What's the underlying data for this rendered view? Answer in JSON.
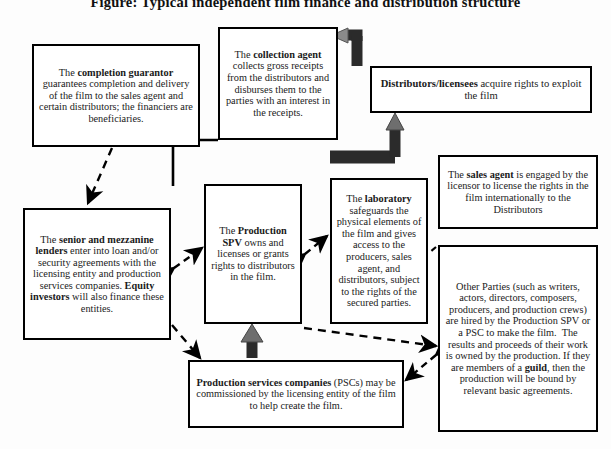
{
  "title": "Figure: Typical independent film finance and distribution structure",
  "diagram": {
    "type": "flow-diagram",
    "nodes": [
      {
        "id": "completion-guarantor",
        "name": "completion-guarantor-box",
        "text_html": "The <b>completion guarantor</b> guarantees completion and delivery of the film to the sales agent and certain distributors; the financiers are beneficiaries.",
        "text": "The completion guarantor guarantees completion and delivery of the film to the sales agent and certain distributors; the financiers are beneficiaries."
      },
      {
        "id": "collection-agent",
        "name": "collection-agent-box",
        "text_html": "The <b>collection agent</b> collects gross receipts from the distributors and disburses them to the parties with an interest in the receipts.",
        "text": "The collection agent collects gross receipts from the distributors and disburses them to the parties with an interest in the receipts."
      },
      {
        "id": "distributors",
        "name": "distributors-licensees-box",
        "text_html": "<b>Distributors/licensees</b> acquire rights to exploit the film",
        "text": "Distributors/licensees acquire rights to exploit the film"
      },
      {
        "id": "sales-agent",
        "name": "sales-agent-box",
        "text_html": "The <b>sales agent</b> is engaged by the licensor to license the rights in the film internationally to the Distributors",
        "text": "The sales agent is engaged by the licensor to license the rights in the film internationally to the Distributors"
      },
      {
        "id": "production-spv",
        "name": "production-spv-box",
        "text_html": "The <b>Production SPV</b> owns and licenses or grants rights to distributors in the film.",
        "text": "The Production SPV owns and licenses or grants rights to distributors in the film."
      },
      {
        "id": "laboratory",
        "name": "laboratory-box",
        "text_html": "The <b>laboratory</b> safeguards the physical elements of the film and gives access to the producers, sales agent, and distributors, subject to the rights of the secured parties.",
        "text": "The laboratory safeguards the physical elements of the film and gives access to the producers, sales agent, and distributors, subject to the rights of the secured parties."
      },
      {
        "id": "lenders",
        "name": "senior-mezzanine-lenders-box",
        "text_html": "The <b>senior and mezzanine lenders</b> enter into loan and/or security agreements with the licensing entity and production services companies. <b>Equity investors</b> will also finance these entities.",
        "text": "The senior and mezzanine lenders enter into loan and/or security agreements with the licensing entity and production services companies. Equity investors will also finance these entities."
      },
      {
        "id": "other-parties",
        "name": "other-parties-box",
        "text_html": "Other Parties (such as writers, actors, directors, composers, producers, and production crews) are hired by the Production SPV or a PSC to make the film.&nbsp; The results and proceeds of their work is owned by the production. If they are members of a <b>guild</b>, then the production will be bound by relevant basic agreements.",
        "text": "Other Parties (such as writers, actors, directors, composers, producers, and production crews) are hired by the Production SPV or a PSC to make the film. The results and proceeds of their work is owned by the production. If they are members of a guild, then the production will be bound by relevant basic agreements."
      },
      {
        "id": "psc",
        "name": "production-services-companies-box",
        "text_html": "<b>Production services companies</b> (PSCs) may be commissioned by the licensing entity of the film to help create the film.",
        "text": "Production services companies (PSCs) may be commissioned by the licensing entity of the film to help create the film."
      }
    ],
    "connectors": [
      {
        "id": "c1",
        "name": "connector-guarantor-to-lenders",
        "style": "dashed-arrow",
        "from": "completion-guarantor",
        "to": "lenders"
      },
      {
        "id": "c2",
        "name": "connector-collection-agent-to-spv",
        "style": "solid-elbow",
        "from": "collection-agent",
        "to": "production-spv"
      },
      {
        "id": "c3",
        "name": "connector-distributors-to-collection-agent",
        "style": "block-arrow",
        "from": "distributors",
        "to": "collection-agent"
      },
      {
        "id": "c4",
        "name": "connector-spv-to-distributors",
        "style": "block-arrow-up",
        "from": "production-spv",
        "to": "distributors"
      },
      {
        "id": "c5",
        "name": "connector-spv-to-laboratory",
        "style": "dashed-double-arrow",
        "from": "production-spv",
        "to": "laboratory"
      },
      {
        "id": "c6",
        "name": "connector-lenders-to-spv",
        "style": "dashed-double-arrow",
        "from": "lenders",
        "to": "production-spv"
      },
      {
        "id": "c7",
        "name": "connector-lenders-to-psc",
        "style": "dashed-arrow",
        "from": "lenders",
        "to": "psc"
      },
      {
        "id": "c8",
        "name": "connector-psc-to-spv",
        "style": "block-arrow-up",
        "from": "psc",
        "to": "production-spv"
      },
      {
        "id": "c9",
        "name": "connector-psc-to-other-parties",
        "style": "dashed-double-arrow",
        "from": "psc",
        "to": "other-parties"
      },
      {
        "id": "c10",
        "name": "connector-spv-to-other-parties",
        "style": "dashed-arrow",
        "from": "production-spv",
        "to": "other-parties"
      },
      {
        "id": "c11",
        "name": "connector-sales-agent-to-spv",
        "style": "dashed-arrow",
        "from": "sales-agent",
        "to": "laboratory"
      }
    ],
    "colors": {
      "stroke": "#000000",
      "fill": "#ffffff",
      "block_arrow_fill": "#2b2b2b",
      "page_bg": "#fdfdfd"
    }
  }
}
